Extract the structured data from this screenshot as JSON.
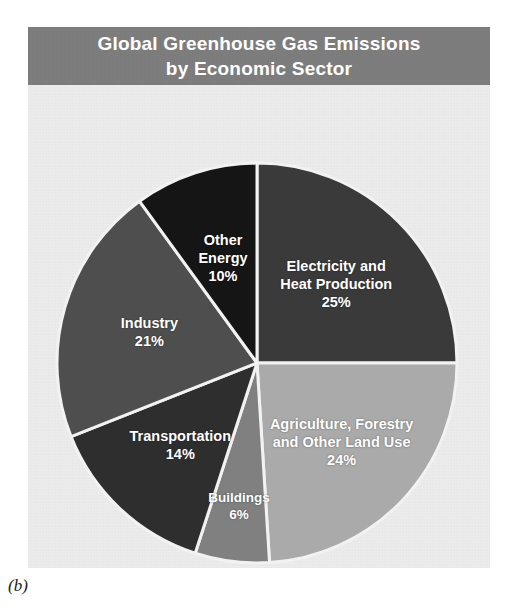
{
  "figure": {
    "caption": "(b)"
  },
  "title": {
    "line1": "Global Greenhouse Gas Emissions",
    "line2": "by Economic Sector",
    "bar_color": "#7d7d7d",
    "text_color": "#ffffff"
  },
  "panel": {
    "background_color": "#eeedee"
  },
  "chart_data": {
    "type": "pie",
    "title": "Global Greenhouse Gas Emissions by Economic Sector",
    "subtitle": "",
    "xlabel": "",
    "ylabel": "",
    "units": "percent",
    "total": 100,
    "start_angle_deg": 0,
    "direction": "clockwise",
    "legend": "none (labels drawn inside slices)",
    "grid": false,
    "categories": [
      "Electricity and Heat Production",
      "Agriculture, Forestry and Other Land Use",
      "Buildings",
      "Transportation",
      "Industry",
      "Other Energy"
    ],
    "values": [
      25,
      24,
      6,
      14,
      21,
      10
    ],
    "colors": [
      "#3a3a3a",
      "#aaaaaa",
      "#808080",
      "#2e2e2e",
      "#4e4e4e",
      "#151515"
    ],
    "slices": [
      {
        "name": "Electricity and Heat Production",
        "label_line1": "Electricity and",
        "label_line2": "Heat Production",
        "value": 25,
        "value_label": "25%",
        "color": "#3a3a3a"
      },
      {
        "name": "Agriculture, Forestry and Other Land Use",
        "label_line1": "Agriculture, Forestry",
        "label_line2": "and Other Land Use",
        "value": 24,
        "value_label": "24%",
        "color": "#aaaaaa"
      },
      {
        "name": "Buildings",
        "label_line1": "Buildings",
        "label_line2": "",
        "value": 6,
        "value_label": "6%",
        "color": "#808080"
      },
      {
        "name": "Transportation",
        "label_line1": "Transportation",
        "label_line2": "",
        "value": 14,
        "value_label": "14%",
        "color": "#2e2e2e"
      },
      {
        "name": "Industry",
        "label_line1": "Industry",
        "label_line2": "",
        "value": 21,
        "value_label": "21%",
        "color": "#4e4e4e"
      },
      {
        "name": "Other Energy",
        "label_line1": "Other",
        "label_line2": "Energy",
        "value": 10,
        "value_label": "10%",
        "color": "#151515"
      }
    ]
  }
}
